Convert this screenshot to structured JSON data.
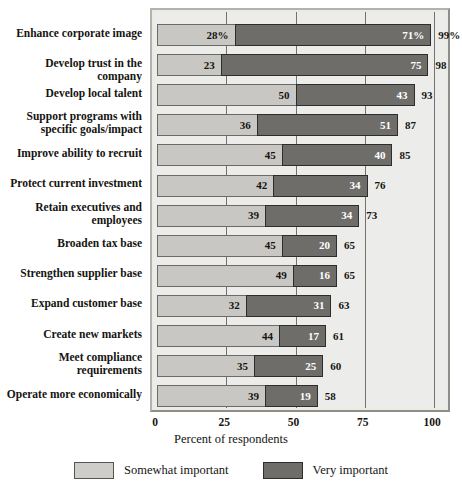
{
  "chart_data": {
    "type": "bar",
    "orientation": "horizontal",
    "stacked": true,
    "title": "",
    "xlabel": "Percent of respondents",
    "ylabel": "",
    "xlim": [
      0,
      100
    ],
    "xticks": [
      "0",
      "25",
      "50",
      "75",
      "100"
    ],
    "xtick_values": [
      0,
      25,
      50,
      75,
      100
    ],
    "grid": true,
    "legend_position": "bottom-center",
    "categories": [
      "Enhance corporate image",
      "Develop trust in the company",
      "Develop local talent",
      "Support programs with specific goals/impact",
      "Improve ability to recruit",
      "Protect current investment",
      "Retain executives and employees",
      "Broaden tax base",
      "Strengthen supplier base",
      "Expand customer base",
      "Create new markets",
      "Meet compliance requirements",
      "Operate more economically"
    ],
    "category_lines": [
      [
        "Enhance corporate image"
      ],
      [
        "Develop trust in the company"
      ],
      [
        "Develop local talent"
      ],
      [
        "Support programs with",
        "specific goals/impact"
      ],
      [
        "Improve ability to recruit"
      ],
      [
        "Protect current investment"
      ],
      [
        "Retain executives and",
        "employees"
      ],
      [
        "Broaden tax base"
      ],
      [
        "Strengthen supplier base"
      ],
      [
        "Expand customer base"
      ],
      [
        "Create new markets"
      ],
      [
        "Meet compliance",
        "requirements"
      ],
      [
        "Operate more economically"
      ]
    ],
    "series": [
      {
        "name": "Somewhat important",
        "color": "#c9c7c4",
        "values": [
          28,
          23,
          50,
          36,
          45,
          42,
          39,
          45,
          49,
          32,
          44,
          35,
          39
        ],
        "labels": [
          "28%",
          "23",
          "50",
          "36",
          "45",
          "42",
          "39",
          "45",
          "49",
          "32",
          "44",
          "35",
          "39"
        ]
      },
      {
        "name": "Very important",
        "color": "#6f6d6a",
        "values": [
          71,
          75,
          43,
          51,
          40,
          34,
          34,
          20,
          16,
          31,
          17,
          25,
          19
        ],
        "labels": [
          "71%",
          "75",
          "43",
          "51",
          "40",
          "34",
          "34",
          "20",
          "16",
          "31",
          "17",
          "25",
          "19"
        ]
      }
    ],
    "totals": [
      99,
      98,
      93,
      87,
      85,
      76,
      73,
      65,
      65,
      63,
      61,
      60,
      58
    ],
    "total_labels": [
      "99%",
      "98",
      "93",
      "87",
      "85",
      "76",
      "73",
      "65",
      "65",
      "63",
      "61",
      "60",
      "58"
    ]
  },
  "legend": {
    "items": [
      {
        "label": "Somewhat important",
        "swatch": "somewhat"
      },
      {
        "label": "Very important",
        "swatch": "very"
      }
    ]
  },
  "colors": {
    "somewhat_important": "#c9c7c4",
    "very_important": "#6f6d6a",
    "plot_background": "#ececea",
    "frame": "#8f8d88",
    "text": "#15140f"
  }
}
